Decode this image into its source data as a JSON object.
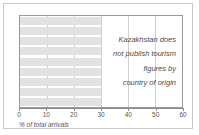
{
  "chart_data": {
    "type": "bar",
    "orientation": "horizontal",
    "title": "",
    "xlabel": "% of total arrivals",
    "ylabel": "",
    "xlim": [
      0,
      60
    ],
    "xticks": [
      0,
      10,
      20,
      30,
      40,
      50,
      60
    ],
    "xtick_labels": [
      "0",
      "10",
      "20",
      "30",
      "40",
      "50",
      "60"
    ],
    "grid": true,
    "grid_axis": "x",
    "legend": null,
    "categories": [
      "",
      "",
      "",
      "",
      "",
      "",
      "",
      "",
      ""
    ],
    "values": [
      30,
      30,
      30,
      30,
      30,
      30,
      30,
      30,
      30
    ],
    "bar_color": "#e2e2e2",
    "annotation_lines": [
      "Kazakhstan does",
      "not publish tourism",
      "figures by",
      "country of origin"
    ],
    "annotation_text": "Kazakhstan does not publish tourism figures by country of origin"
  },
  "colors": {
    "frame_border": "#c9c9c9",
    "plot_border": "#9a9a9a",
    "gridline": "#d2d2d2",
    "bar_fill": "#e2e2e2",
    "axis": "#8a8a8a",
    "text": "#555555",
    "annotation_text": "#4a4a4a",
    "background": "#ffffff"
  }
}
